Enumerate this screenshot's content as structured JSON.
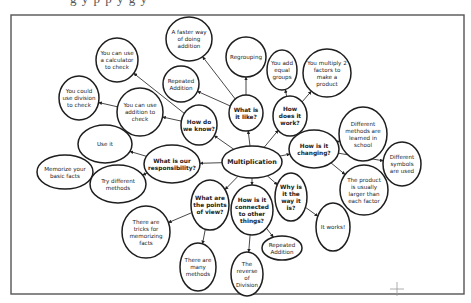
{
  "page": {
    "cut_off_header_text": "g  y  p  p  y  g  y"
  },
  "diagram": {
    "type": "concept-map",
    "central_topic": "Multiplication",
    "nodes": [
      {
        "id": "multiplication",
        "lines": [
          "Multiplication"
        ],
        "kind": "main",
        "cx": 252,
        "cy": 162,
        "rx": 30,
        "ry": 16
      },
      {
        "id": "what-is-it-like",
        "lines": [
          "What is",
          "it like?"
        ],
        "kind": "q",
        "cx": 246,
        "cy": 113,
        "rx": 17,
        "ry": 18
      },
      {
        "id": "how-does-it-work",
        "lines": [
          "How",
          "does it",
          "work?"
        ],
        "kind": "q",
        "cx": 290,
        "cy": 116,
        "rx": 17,
        "ry": 20
      },
      {
        "id": "how-do-we-know",
        "lines": [
          "How do",
          "we know?"
        ],
        "kind": "q",
        "cx": 199,
        "cy": 125,
        "rx": 18,
        "ry": 20
      },
      {
        "id": "how-is-it-changing",
        "lines": [
          "How is it",
          "changing?"
        ],
        "kind": "q",
        "cx": 314,
        "cy": 149,
        "rx": 25,
        "ry": 19
      },
      {
        "id": "what-is-our-responsibility",
        "lines": [
          "What is our",
          "responsibility?"
        ],
        "kind": "q",
        "cx": 172,
        "cy": 164,
        "rx": 28,
        "ry": 19
      },
      {
        "id": "what-are-the-points-of-view",
        "lines": [
          "What are",
          "the points",
          "of view?"
        ],
        "kind": "q",
        "cx": 210,
        "cy": 205,
        "rx": 19,
        "ry": 25
      },
      {
        "id": "how-is-it-connected",
        "lines": [
          "How is it",
          "connected",
          "to other",
          "things?"
        ],
        "kind": "q",
        "cx": 252,
        "cy": 210,
        "rx": 21,
        "ry": 25
      },
      {
        "id": "why-is-it-the-way-it-is",
        "lines": [
          "Why is",
          "it the",
          "way it",
          "is?"
        ],
        "kind": "q",
        "cx": 291,
        "cy": 197,
        "rx": 16,
        "ry": 24
      },
      {
        "id": "faster-way-addition",
        "lines": [
          "A faster way",
          "of doing",
          "addition"
        ],
        "kind": "a",
        "cx": 189,
        "cy": 39,
        "rx": 23,
        "ry": 22
      },
      {
        "id": "regrouping",
        "lines": [
          "Regrouping"
        ],
        "kind": "a",
        "cx": 246,
        "cy": 57,
        "rx": 20,
        "ry": 20
      },
      {
        "id": "repeated-addition-top",
        "lines": [
          "Repeated",
          "Addition"
        ],
        "kind": "a",
        "cx": 181,
        "cy": 84,
        "rx": 18,
        "ry": 18
      },
      {
        "id": "you-add-equal-groups",
        "lines": [
          "You add",
          "equal",
          "groups"
        ],
        "kind": "a",
        "cx": 282,
        "cy": 70,
        "rx": 15,
        "ry": 20
      },
      {
        "id": "you-multiply-2-factors",
        "lines": [
          "You multiply 2",
          "factors to",
          "make a",
          "product"
        ],
        "kind": "a",
        "cx": 327,
        "cy": 73,
        "rx": 24,
        "ry": 24
      },
      {
        "id": "calculator-check",
        "lines": [
          "You can use",
          "a calculator",
          "to check"
        ],
        "kind": "a",
        "cx": 117,
        "cy": 60,
        "rx": 21,
        "ry": 22
      },
      {
        "id": "division-check",
        "lines": [
          "You could",
          "use division",
          "to check"
        ],
        "kind": "a",
        "cx": 79,
        "cy": 98,
        "rx": 20,
        "ry": 22
      },
      {
        "id": "addition-check",
        "lines": [
          "You can use",
          "addition to",
          "check"
        ],
        "kind": "a",
        "cx": 140,
        "cy": 112,
        "rx": 23,
        "ry": 24
      },
      {
        "id": "different-methods-school",
        "lines": [
          "Different",
          "methods are",
          "learned in",
          "school"
        ],
        "kind": "a",
        "cx": 363,
        "cy": 134,
        "rx": 24,
        "ry": 27
      },
      {
        "id": "different-symbols",
        "lines": [
          "Different",
          "symbols",
          "are used"
        ],
        "kind": "a",
        "cx": 402,
        "cy": 164,
        "rx": 19,
        "ry": 22
      },
      {
        "id": "product-larger",
        "lines": [
          "The product",
          "is usually",
          "larger than",
          "each factor"
        ],
        "kind": "a",
        "cx": 364,
        "cy": 190,
        "rx": 24,
        "ry": 25
      },
      {
        "id": "it-works",
        "lines": [
          "It works!"
        ],
        "kind": "a",
        "cx": 333,
        "cy": 227,
        "rx": 17,
        "ry": 24
      },
      {
        "id": "use-it",
        "lines": [
          "Use it"
        ],
        "kind": "a",
        "cx": 105,
        "cy": 144,
        "rx": 27,
        "ry": 19
      },
      {
        "id": "memorize-basic-facts",
        "lines": [
          "Memorize your",
          "basic facts"
        ],
        "kind": "a",
        "cx": 65,
        "cy": 172,
        "rx": 28,
        "ry": 17
      },
      {
        "id": "try-different-methods",
        "lines": [
          "Try different",
          "methods"
        ],
        "kind": "a",
        "cx": 118,
        "cy": 184,
        "rx": 28,
        "ry": 19
      },
      {
        "id": "tricks-memorizing",
        "lines": [
          "There are",
          "tricks for",
          "memorizing",
          "facts"
        ],
        "kind": "a",
        "cx": 146,
        "cy": 232,
        "rx": 24,
        "ry": 26
      },
      {
        "id": "many-methods",
        "lines": [
          "There are",
          "many",
          "methods"
        ],
        "kind": "a",
        "cx": 198,
        "cy": 267,
        "rx": 18,
        "ry": 24
      },
      {
        "id": "repeated-addition-bottom",
        "lines": [
          "Repeated",
          "Addition"
        ],
        "kind": "a",
        "cx": 282,
        "cy": 248,
        "rx": 20,
        "ry": 12
      },
      {
        "id": "reverse-of-division",
        "lines": [
          "The",
          "reverse",
          "of",
          "Division"
        ],
        "kind": "a",
        "cx": 247,
        "cy": 274,
        "rx": 16,
        "ry": 22
      }
    ],
    "edges": [
      [
        "multiplication",
        "what-is-it-like"
      ],
      [
        "multiplication",
        "how-does-it-work"
      ],
      [
        "multiplication",
        "how-do-we-know"
      ],
      [
        "multiplication",
        "how-is-it-changing"
      ],
      [
        "multiplication",
        "what-is-our-responsibility"
      ],
      [
        "multiplication",
        "what-are-the-points-of-view"
      ],
      [
        "multiplication",
        "how-is-it-connected"
      ],
      [
        "multiplication",
        "why-is-it-the-way-it-is"
      ],
      [
        "what-is-it-like",
        "faster-way-addition"
      ],
      [
        "what-is-it-like",
        "regrouping"
      ],
      [
        "what-is-it-like",
        "repeated-addition-top"
      ],
      [
        "how-does-it-work",
        "you-add-equal-groups"
      ],
      [
        "how-does-it-work",
        "you-multiply-2-factors"
      ],
      [
        "how-do-we-know",
        "calculator-check"
      ],
      [
        "how-do-we-know",
        "addition-check"
      ],
      [
        "addition-check",
        "division-check"
      ],
      [
        "how-is-it-changing",
        "different-methods-school"
      ],
      [
        "how-is-it-changing",
        "different-symbols"
      ],
      [
        "how-is-it-changing",
        "product-larger"
      ],
      [
        "why-is-it-the-way-it-is",
        "it-works"
      ],
      [
        "what-is-our-responsibility",
        "use-it"
      ],
      [
        "what-is-our-responsibility",
        "try-different-methods"
      ],
      [
        "try-different-methods",
        "memorize-basic-facts"
      ],
      [
        "what-are-the-points-of-view",
        "tricks-memorizing"
      ],
      [
        "what-are-the-points-of-view",
        "many-methods"
      ],
      [
        "how-is-it-connected",
        "repeated-addition-bottom"
      ],
      [
        "how-is-it-connected",
        "reverse-of-division"
      ]
    ]
  }
}
